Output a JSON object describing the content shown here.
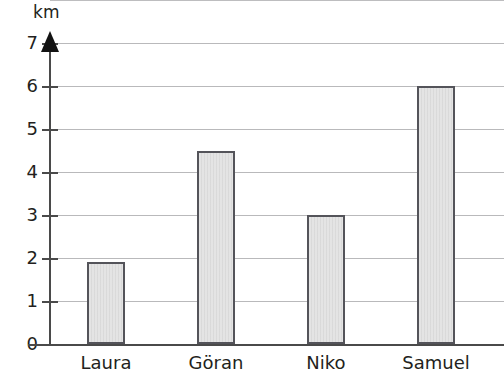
{
  "chart_data": {
    "type": "bar",
    "title": "",
    "subtitle": "",
    "xlabel": "",
    "ylabel": "km",
    "categories": [
      "Laura",
      "Göran",
      "Niko",
      "Samuel"
    ],
    "values": [
      1.9,
      4.5,
      3.0,
      6.0
    ],
    "series": [
      {
        "name": "Distance",
        "values": [
          1.9,
          4.5,
          3.0,
          6.0
        ]
      }
    ],
    "ylim": [
      0,
      8
    ],
    "ytick_labels": [
      "0",
      "1",
      "2",
      "3",
      "4",
      "5",
      "6",
      "7"
    ],
    "ytick_values": [
      0,
      1,
      2,
      3,
      4,
      5,
      6,
      7
    ],
    "grid": true,
    "grid_orientation": "horizontal",
    "legend": false,
    "legend_position": "none",
    "annotations": [],
    "colors": {
      "bar_fill": "#e4e4e4",
      "bar_border": "#54545a",
      "gridline": "#b9b9bb",
      "axis": "#4a4a4a",
      "text": "#231f20",
      "background": "#ffffff"
    }
  }
}
